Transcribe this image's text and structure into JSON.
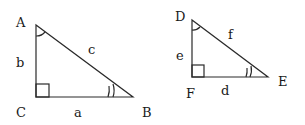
{
  "diagram": {
    "triangles": [
      {
        "name": "ABC",
        "vertices": {
          "A": "A",
          "B": "B",
          "C": "C"
        },
        "sides": {
          "a": "a",
          "b": "b",
          "c": "c"
        },
        "right_angle_at": "C",
        "single_arc_at": "A",
        "double_arc_at": "B"
      },
      {
        "name": "DEF",
        "vertices": {
          "D": "D",
          "E": "E",
          "F": "F"
        },
        "sides": {
          "d": "d",
          "e": "e",
          "f": "f"
        },
        "right_angle_at": "F",
        "single_arc_at": "D",
        "double_arc_at": "E"
      }
    ],
    "colors": {
      "stroke": "#2a2a2a",
      "text": "#1a1a1a",
      "background": "#ffffff"
    }
  }
}
